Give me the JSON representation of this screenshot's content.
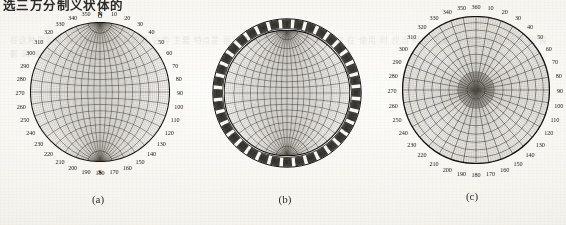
{
  "page": {
    "heading_cropped": "选三万分制义状体的",
    "bleed_through_text": "在这种投影中 经线和纬线 都是圆弧 它的 主要 特点是 面积 保持不变 而 角度 有 畸变 在 使用 时 应当 根据 具体 的 需要 选择 适当 的 投影 网 来 进行 统计 分析 工作"
  },
  "figure": {
    "caption_a": "(a)",
    "caption_b": "(b)",
    "caption_c": "(c)",
    "panels": [
      {
        "id": "a",
        "type": "meridional-stereographic-net",
        "label_style": "outside-circle",
        "north_label": "N",
        "south_label": "S",
        "zero_label": "O",
        "zero_is_360": false,
        "degree_labels": [
          "0",
          "10",
          "20",
          "30",
          "40",
          "50",
          "60",
          "70",
          "80",
          "90",
          "100",
          "110",
          "120",
          "130",
          "140",
          "150",
          "160",
          "170",
          "180",
          "190",
          "200",
          "210",
          "220",
          "230",
          "240",
          "250",
          "260",
          "270",
          "280",
          "290",
          "300",
          "310",
          "320",
          "330",
          "340",
          "350"
        ],
        "meridian_step_deg": 2,
        "parallel_step_deg": 2,
        "has_outer_ring_band": false
      },
      {
        "id": "b",
        "type": "meridional-stereographic-net",
        "label_style": "inside-annular-ring",
        "north_label": "",
        "south_label": "",
        "zero_label": "0",
        "zero_is_360": false,
        "degree_labels": [
          "0",
          "10",
          "20",
          "30",
          "40",
          "50",
          "60",
          "70",
          "80",
          "90",
          "100",
          "110",
          "120",
          "130",
          "140",
          "150",
          "160",
          "170",
          "180",
          "190",
          "200",
          "210",
          "220",
          "230",
          "240",
          "250",
          "260",
          "270",
          "280",
          "290",
          "300",
          "310",
          "320",
          "330",
          "340",
          "350"
        ],
        "meridian_step_deg": 2,
        "parallel_step_deg": 2,
        "has_outer_ring_band": true,
        "ring_tick_count": 36
      },
      {
        "id": "c",
        "type": "polar-equal-area-net",
        "label_style": "outside-circle",
        "north_label": "",
        "south_label": "",
        "zero_label": "360",
        "zero_is_360": true,
        "degree_labels": [
          "360",
          "10",
          "20",
          "30",
          "40",
          "50",
          "60",
          "70",
          "80",
          "90",
          "100",
          "110",
          "120",
          "130",
          "140",
          "150",
          "160",
          "170",
          "180",
          "190",
          "200",
          "210",
          "220",
          "230",
          "240",
          "250",
          "260",
          "270",
          "280",
          "290",
          "300",
          "310",
          "320",
          "330",
          "340",
          "350"
        ],
        "radial_step_deg": 2,
        "ring_step_deg": 2,
        "has_outer_ring_band": false,
        "has_dense_center": true
      }
    ]
  },
  "colors": {
    "paper": "#fbfaf7",
    "ink": "#1f1e1b",
    "grid": "#2a2824",
    "grid_light": "#6d695f",
    "caption": "#2e2d29"
  }
}
